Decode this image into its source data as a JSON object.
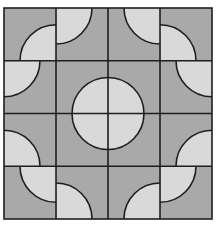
{
  "figure": {
    "origin": [
      4,
      8
    ],
    "cell_size": [
      52,
      52.75
    ],
    "rows": 4,
    "cols": 4,
    "arc_radius": 36,
    "colors": {
      "background": "#ffffff",
      "dark_fill": "#a9a9a9",
      "light_fill": "#d9d9d9",
      "line": "#1e1e1e"
    },
    "cells": [
      [
        "br",
        "tl",
        "tr",
        "bl"
      ],
      [
        "tl",
        "br",
        "bl",
        "tr"
      ],
      [
        "bl",
        "tr",
        "tl",
        "br"
      ],
      [
        "tr",
        "bl",
        "br",
        "tl"
      ]
    ]
  }
}
